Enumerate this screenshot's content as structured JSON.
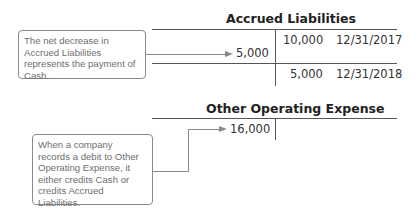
{
  "accrued_liabilities": {
    "title": "Accrued Liabilities",
    "credits": [
      {
        "amount": "10,000",
        "date": "12/31/2017"
      }
    ],
    "debits": [
      {
        "amount": "5,000"
      }
    ],
    "balance": {
      "amount": "5,000",
      "date": "12/31/2018"
    },
    "callout": "The net decrease in Accrued Liabilities represents the payment of Cash."
  },
  "other_operating_expense": {
    "title": "Other Operating Expense",
    "debits": [
      {
        "amount": "16,000"
      }
    ],
    "callout": "When a company records a debit to Other Operating Expense, it either credits Cash or credits Accrued Liabilities."
  },
  "colors": {
    "lines": "#555555",
    "callout_border": "#8a8a8a",
    "callout_text": "#6e6e6e"
  }
}
